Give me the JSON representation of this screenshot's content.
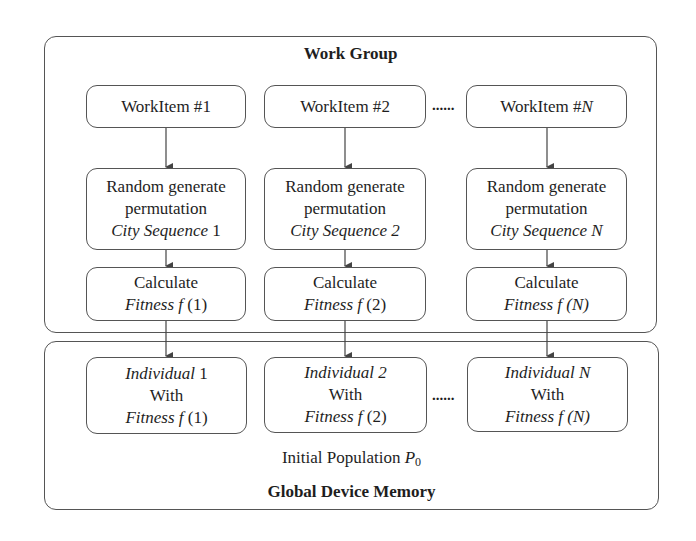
{
  "work_group": {
    "title": "Work Group",
    "work_items": [
      {
        "label": "WorkItem #",
        "index": "1",
        "index_italic": false
      },
      {
        "label": "WorkItem #",
        "index": "2",
        "index_italic": false
      },
      {
        "label": "WorkItem #",
        "index": "N",
        "index_italic": true
      }
    ],
    "separator": "......",
    "generate_boxes": [
      {
        "line1": "Random generate",
        "line2": "permutation",
        "line3_italic": "City Sequence",
        "line3_index": " 1"
      },
      {
        "line1": "Random generate",
        "line2": "permutation",
        "line3_italic": "City Sequence",
        "line3_index": " 2"
      },
      {
        "line1": "Random generate",
        "line2": "permutation",
        "line3_italic": "City Sequence",
        "line3_index": " N"
      }
    ],
    "calculate_boxes": [
      {
        "line1": "Calculate",
        "fitness_label": "Fitness f",
        "arg": "(1)"
      },
      {
        "line1": "Calculate",
        "fitness_label": "Fitness f",
        "arg": "(2)"
      },
      {
        "line1": "Calculate",
        "fitness_label": "Fitness f",
        "arg": "(N)"
      }
    ]
  },
  "global_memory": {
    "title": "Global Device Memory",
    "population_label": "Initial Population ",
    "population_symbol": "P",
    "population_subscript": "0",
    "separator": "......",
    "individuals": [
      {
        "name_italic": "Individual",
        "index": " 1",
        "line2": "With",
        "fitness_label": "Fitness f",
        "arg": "(1)"
      },
      {
        "name_italic": "Individual",
        "index": " 2",
        "line2": "With",
        "fitness_label": "Fitness f",
        "arg": "(2)"
      },
      {
        "name_italic": "Individual",
        "index": " N",
        "line2": "With",
        "fitness_label": "Fitness f",
        "arg": "(N)"
      }
    ]
  },
  "colors": {
    "stroke": "#555555",
    "text": "#1e1e1e",
    "background": "#ffffff"
  }
}
